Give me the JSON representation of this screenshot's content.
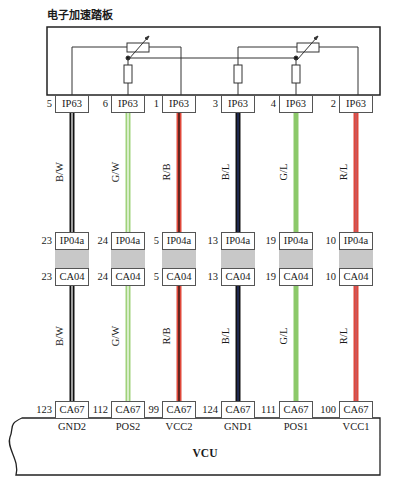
{
  "diagram": {
    "title": "电子加速踏板",
    "ecu_label": "VCU",
    "colors": {
      "B/W": [
        "#111111",
        "#ffffff"
      ],
      "G/W": [
        "#9fd27a",
        "#ffffff"
      ],
      "R/B": [
        "#e0483a",
        "#111111"
      ],
      "B/L": [
        "#111111",
        "#2a3a7a"
      ],
      "G/L": [
        "#8cc96a",
        "#8cc96a"
      ],
      "R/L": [
        "#e0483a",
        "#c06070"
      ]
    },
    "circuits": [
      {
        "x": 72,
        "ip63_pin": "5",
        "ip63": "IP63",
        "wire_color": "B/W",
        "ip04a_pin": "23",
        "ip04a": "IP04a",
        "ca04_pin": "23",
        "ca04": "CA04",
        "ca67_pin": "123",
        "ca67": "CA67",
        "signal": "GND2"
      },
      {
        "x": 128,
        "ip63_pin": "6",
        "ip63": "IP63",
        "wire_color": "G/W",
        "ip04a_pin": "24",
        "ip04a": "IP04a",
        "ca04_pin": "24",
        "ca04": "CA04",
        "ca67_pin": "112",
        "ca67": "CA67",
        "signal": "POS2"
      },
      {
        "x": 179,
        "ip63_pin": "1",
        "ip63": "IP63",
        "wire_color": "R/B",
        "ip04a_pin": "5",
        "ip04a": "IP04a",
        "ca04_pin": "5",
        "ca04": "CA04",
        "ca67_pin": "99",
        "ca67": "CA67",
        "signal": "VCC2"
      },
      {
        "x": 238,
        "ip63_pin": "3",
        "ip63": "IP63",
        "wire_color": "B/L",
        "ip04a_pin": "13",
        "ip04a": "IP04a",
        "ca04_pin": "13",
        "ca04": "CA04",
        "ca67_pin": "124",
        "ca67": "CA67",
        "signal": "GND1"
      },
      {
        "x": 296,
        "ip63_pin": "4",
        "ip63": "IP63",
        "wire_color": "G/L",
        "ip04a_pin": "19",
        "ip04a": "IP04a",
        "ca04_pin": "19",
        "ca04": "CA04",
        "ca67_pin": "111",
        "ca67": "CA67",
        "signal": "POS1"
      },
      {
        "x": 356,
        "ip63_pin": "2",
        "ip63": "IP63",
        "wire_color": "R/L",
        "ip04a_pin": "10",
        "ip04a": "IP04a",
        "ca04_pin": "10",
        "ca04": "CA04",
        "ca67_pin": "100",
        "ca67": "CA67",
        "signal": "VCC1"
      }
    ]
  }
}
